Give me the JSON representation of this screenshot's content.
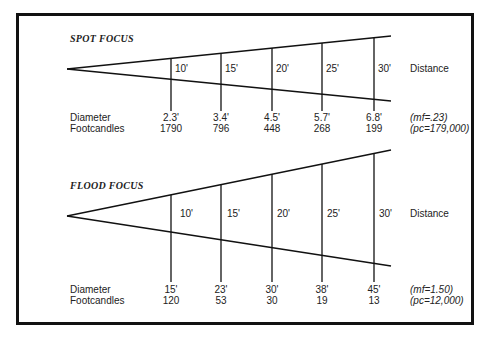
{
  "spot": {
    "title": "SPOT FOCUS",
    "distances": [
      "10'",
      "15'",
      "20'",
      "25'",
      "30'"
    ],
    "distance_label": "Distance",
    "row_labels": [
      "Diameter",
      "Footcandles"
    ],
    "diameters": [
      "2.3'",
      "3.4'",
      "4.5'",
      "5.7'",
      "6.8'"
    ],
    "footcandles": [
      "1790",
      "796",
      "448",
      "268",
      "199"
    ],
    "mf": "(mf=.23)",
    "pc": "(pc=179,000)"
  },
  "flood": {
    "title": "FLOOD FOCUS",
    "distances": [
      "10'",
      "15'",
      "20'",
      "25'",
      "30'"
    ],
    "distance_label": "Distance",
    "row_labels": [
      "Diameter",
      "Footcandles"
    ],
    "diameters": [
      "15'",
      "23'",
      "30'",
      "38'",
      "45'"
    ],
    "footcandles": [
      "120",
      "53",
      "30",
      "19",
      "13"
    ],
    "mf": "(mf=1.50)",
    "pc": "(pc=12,000)"
  }
}
